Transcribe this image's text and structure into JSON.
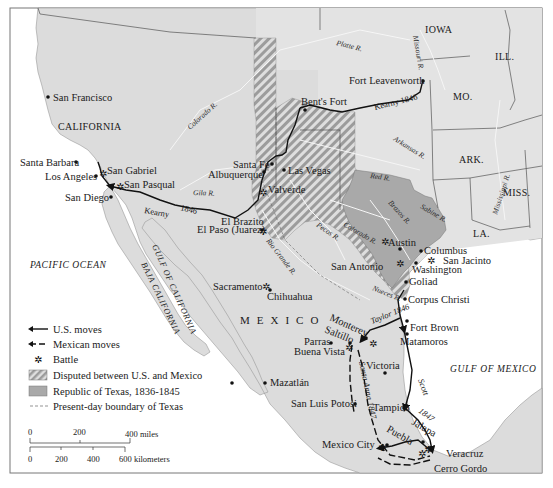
{
  "map": {
    "ocean_labels": {
      "pacific": "PACIFIC OCEAN",
      "gulf_mexico": "GULF OF MEXICO",
      "gulf_california": "GULF OF CALIFORNIA",
      "baja": "BAJA CALIFORNIA"
    },
    "regions": {
      "california": "CALIFORNIA",
      "mexico": "MEXICO",
      "iowa": "IOWA",
      "ill": "ILL.",
      "mo": "MO.",
      "ark": "ARK.",
      "miss": "MISS.",
      "la": "LA."
    },
    "rivers": {
      "platte": "Platte R.",
      "missouri": "Missouri R.",
      "colorado_w": "Colorado R.",
      "arkansas": "Arkansas R.",
      "red": "Red R.",
      "mississippi": "Mississippi R.",
      "gila": "Gila R.",
      "brazos": "Brazos R.",
      "sabine": "Sabine R.",
      "colorado_tx": "Colorado R.",
      "pecos": "Pecos R.",
      "rio_grande": "Rio Grande R.",
      "nueces": "Nueces R."
    },
    "cities": {
      "san_francisco": "San Francisco",
      "santa_barbara": "Santa Barbara",
      "los_angeles": "Los Angeles",
      "san_gabriel": "San Gabriel",
      "san_pasqual": "San Pasqual",
      "san_diego": "San Diego",
      "santa_fe": "Santa Fe",
      "albuquerque": "Albuquerque",
      "las_vegas": "Las Vegas",
      "valverde": "Valverde",
      "bents_fort": "Bent's Fort",
      "fort_leavenworth": "Fort Leavenworth",
      "el_brazito": "El Brazito",
      "el_paso": "El Paso (Juarez)",
      "sacramento": "Sacramento",
      "chihuahua": "Chihuahua",
      "austin": "Austin",
      "columbus": "Columbus",
      "san_jacinto": "San Jacinto",
      "washington": "Washington",
      "san_antonio": "San Antonio",
      "goliad": "Goliad",
      "corpus_christi": "Corpus Christi",
      "fort_brown": "Fort Brown",
      "matamoros": "Matamoros",
      "monterey": "Monterey",
      "saltillo": "Saltillo",
      "parras": "Parras",
      "buena_vista": "Buena Vista",
      "victoria": "Victoria",
      "mazatlan": "Mazatlán",
      "san_luis_potosi": "San Luis Potosi",
      "tampico": "Tampico",
      "mexico_city": "Mexico City",
      "puebla": "Puebla",
      "jalapa": "Jalapa",
      "veracruz": "Veracruz",
      "cerro_gordo": "Cerro Gordo"
    },
    "routes": {
      "kearny_east": "Kearny 1846",
      "kearny_west_a": "Kearny",
      "kearny_west_b": "1846",
      "taylor": "Taylor 1846",
      "scott": "Scott",
      "scott_year": "1847",
      "santa_anna": "Santa Anna 1847"
    }
  },
  "legend": {
    "items": [
      {
        "key": "us_moves",
        "label": "U.S. moves"
      },
      {
        "key": "mexican_moves",
        "label": "Mexican moves"
      },
      {
        "key": "battle",
        "label": "Battle"
      },
      {
        "key": "disputed",
        "label": "Disputed between U.S. and Mexico"
      },
      {
        "key": "texas_republic",
        "label": "Republic of Texas, 1836-1845"
      },
      {
        "key": "boundary",
        "label": "Present-day boundary of Texas"
      }
    ]
  },
  "scale": {
    "miles_ticks": [
      "0",
      "200",
      "400 miles"
    ],
    "km_ticks": [
      "0",
      "200",
      "400",
      "600 kilometers"
    ]
  },
  "colors": {
    "land": "#dcdcdc",
    "us_land": "#e1e1e1",
    "texas": "#a9a9a9",
    "water": "#ffffff",
    "ink": "#111111",
    "river": "#f4f4f4"
  }
}
